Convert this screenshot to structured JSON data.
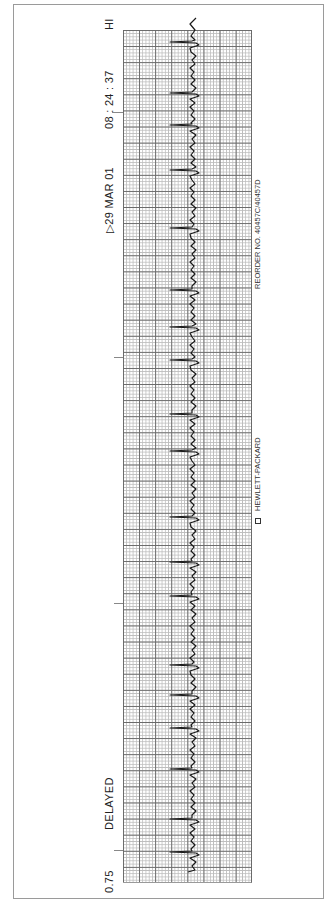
{
  "strip": {
    "top_labels": {
      "hi": "HI",
      "time": "08 : 24 : 37",
      "date": "▷29  MAR  01"
    },
    "bottom_labels": {
      "delayed": "DELAYED",
      "speed": "0.75"
    },
    "side_labels": {
      "reorder": "REORDER NO. 40457C/40457D",
      "brand": "HEWLETT-PACKARD"
    },
    "icons": {
      "brand_logo": "hp-logo-icon",
      "date_marker": "triangle-marker-icon"
    },
    "colors": {
      "trace": "#1a1a1a",
      "grid_major": "#6a6a6a",
      "grid_minor": "#bdbdbd",
      "paper": "#ffffff"
    },
    "qrs_positions_y": [
      42,
      93,
      125,
      170,
      228,
      290,
      327,
      360,
      414,
      451,
      517,
      562,
      596,
      665,
      695,
      728,
      769,
      819,
      852
    ]
  }
}
